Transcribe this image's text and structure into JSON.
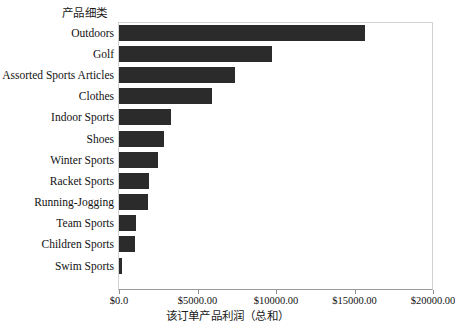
{
  "chart_data": {
    "type": "bar",
    "orientation": "horizontal",
    "title": "",
    "ylabel": "产品细类",
    "xlabel": "该订单产品利润（总和）",
    "categories": [
      "Outdoors",
      "Golf",
      "Assorted Sports Articles",
      "Clothes",
      "Indoor Sports",
      "Shoes",
      "Winter Sports",
      "Racket Sports",
      "Running-Jogging",
      "Team Sports",
      "Children Sports",
      "Swim Sports"
    ],
    "values": [
      15640,
      9740,
      7370,
      5900,
      3330,
      2880,
      2500,
      1920,
      1860,
      1090,
      1020,
      190
    ],
    "xlim": [
      0,
      20000
    ],
    "xticks": [
      0,
      5000,
      10000,
      15000,
      20000
    ],
    "xticklabels": [
      "$0.0",
      "$5000.00",
      "$10000.00",
      "$15000.00",
      "$20000.00"
    ],
    "grid": false,
    "legend": false,
    "bar_color": "#2b2b2b",
    "frame_color": "#d2d2d2",
    "axis_color": "#9a9a9a",
    "background": "#ffffff"
  }
}
